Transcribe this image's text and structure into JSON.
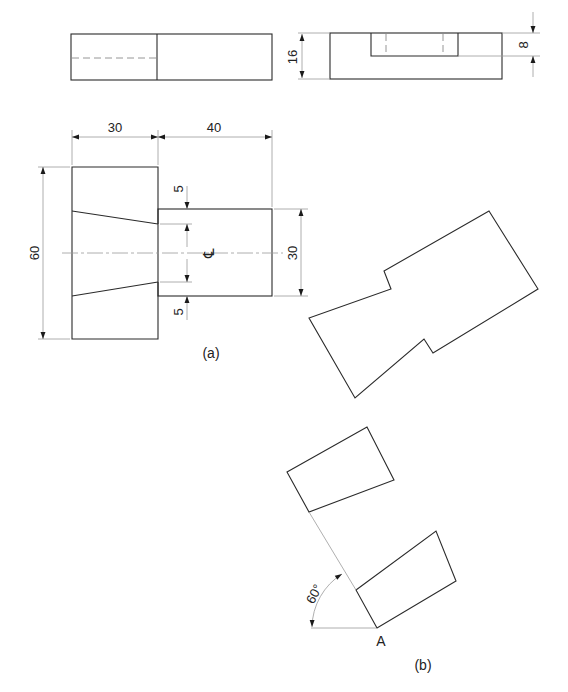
{
  "figure": {
    "views": {
      "front_elevation": {
        "label": ""
      },
      "side_elevation": {
        "dim_height": "16",
        "dim_slot_depth": "8"
      },
      "plan_a": {
        "caption": "(a)",
        "dim_left_width": "30",
        "dim_right_width": "40",
        "dim_total_height": "60",
        "dim_right_height": "30",
        "dim_gap_top": "5",
        "dim_gap_bottom": "5",
        "centerline_symbol": "℄"
      },
      "construction_b": {
        "caption": "(b)",
        "angle_label": "60°",
        "point_label": "A"
      }
    },
    "colors": {
      "object_line": "#2a2a2a",
      "thin_line": "#9a9a9a",
      "background": "#ffffff"
    }
  }
}
